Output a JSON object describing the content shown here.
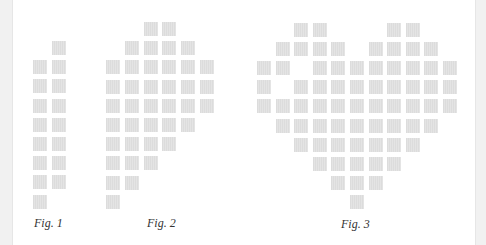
{
  "colors": {
    "tile": "#e0e0e0",
    "background": "#ffffff",
    "strip": "#f1f1f1",
    "label": "#333333"
  },
  "figures": [
    {
      "label": "Fig. 1",
      "origin": [
        33,
        41
      ],
      "pitch": [
        18.5,
        19.2
      ],
      "rows": [
        [
          1
        ],
        [
          0,
          1
        ],
        [
          0,
          1
        ],
        [
          0,
          1
        ],
        [
          0,
          1
        ],
        [
          0,
          1
        ],
        [
          0,
          1
        ],
        [
          0,
          1
        ],
        [
          0
        ]
      ],
      "label_pos": [
        34,
        216
      ]
    },
    {
      "label": "Fig. 2",
      "origin": [
        106,
        22
      ],
      "pitch": [
        18.8,
        19.2
      ],
      "rows": [
        [
          2,
          3
        ],
        [
          1,
          2,
          3,
          4
        ],
        [
          0,
          1,
          2,
          3,
          4,
          5
        ],
        [
          0,
          1,
          2,
          3,
          4,
          5
        ],
        [
          0,
          1,
          2,
          3,
          4,
          5
        ],
        [
          0,
          1,
          2,
          3,
          4
        ],
        [
          0,
          1,
          2,
          3
        ],
        [
          0,
          1,
          2
        ],
        [
          0,
          1
        ],
        [
          0
        ]
      ],
      "label_pos": [
        147,
        216
      ]
    },
    {
      "label": "Fig. 3",
      "origin": [
        257,
        23
      ],
      "pitch": [
        18.6,
        19.1
      ],
      "rows": [
        [
          2,
          3,
          7,
          8
        ],
        [
          1,
          2,
          3,
          4,
          6,
          7,
          8,
          9
        ],
        [
          0,
          1,
          3,
          4,
          5,
          6,
          7,
          8,
          9,
          10
        ],
        [
          0,
          2,
          3,
          4,
          5,
          6,
          7,
          8,
          9,
          10
        ],
        [
          0,
          1,
          2,
          3,
          4,
          5,
          6,
          7,
          8,
          9,
          10
        ],
        [
          1,
          2,
          3,
          4,
          5,
          6,
          7,
          8,
          9
        ],
        [
          2,
          3,
          4,
          5,
          6,
          7,
          8
        ],
        [
          3,
          4,
          5,
          6,
          7
        ],
        [
          4,
          5,
          6
        ],
        [
          5
        ]
      ],
      "label_pos": [
        341,
        217
      ]
    }
  ]
}
